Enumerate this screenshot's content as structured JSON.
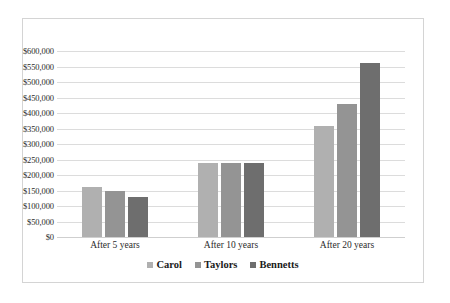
{
  "chart_data": {
    "type": "bar",
    "title": "",
    "subtitle": "",
    "xlabel": "",
    "ylabel": "",
    "categories": [
      "After 5 years",
      "After 10 years",
      "After 20 years"
    ],
    "series": [
      {
        "name": "Carol",
        "color": "#b0b0b0",
        "values": [
          160000,
          238000,
          358000
        ]
      },
      {
        "name": "Taylors",
        "color": "#949494",
        "values": [
          150000,
          239000,
          428000
        ]
      },
      {
        "name": "Bennetts",
        "color": "#6e6e6e",
        "values": [
          130000,
          239000,
          560000
        ]
      }
    ],
    "ylim": [
      0,
      600000
    ],
    "ytick_step": 50000,
    "ytick_labels": [
      "$600,000",
      "$550,000",
      "$500,000",
      "$450,000",
      "$400,000",
      "$350,000",
      "$300,000",
      "$250,000",
      "$200,000",
      "$150,000",
      "$100,000",
      "$50,000",
      "$0"
    ],
    "grid": true,
    "grid_axis": "y",
    "legend_position": "bottom",
    "legend": [
      "Carol",
      "Taylors",
      "Bennetts"
    ],
    "background_color": "#ffffff",
    "border_color": "#d4d4d4",
    "gridline_color": "#dcdcdc"
  }
}
